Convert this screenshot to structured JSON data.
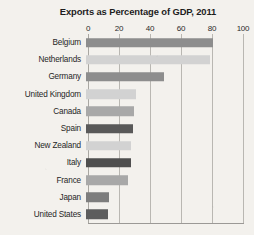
{
  "chart_data": {
    "type": "bar",
    "orientation": "horizontal",
    "title": "Exports as Percentage of GDP, 2011",
    "xlabel": "",
    "ylabel": "",
    "xlim": [
      0,
      100
    ],
    "xticks": [
      0,
      20,
      40,
      60,
      80,
      100
    ],
    "xtick_labels": [
      "0",
      "20",
      "40",
      "60",
      "80",
      "100"
    ],
    "grid": true,
    "legend": null,
    "categories": [
      "Belgium",
      "Netherlands",
      "Germany",
      "United Kingdom",
      "Canada",
      "Spain",
      "New Zealand",
      "Italy",
      "France",
      "Japan",
      "United States"
    ],
    "values": [
      82,
      80,
      50,
      32,
      31,
      30,
      29,
      29,
      27,
      15,
      14
    ],
    "bar_colors": [
      "#8d8d8d",
      "#d2d2d2",
      "#8d8d8d",
      "#d2d2d2",
      "#a8a8a8",
      "#595959",
      "#d2d2d2",
      "#4f4f4f",
      "#a8a8a8",
      "#7d7d7d",
      "#5d5d5d"
    ],
    "bars": [
      {
        "label": "Belgium",
        "value": 82,
        "color": "#8d8d8d"
      },
      {
        "label": "Netherlands",
        "value": 80,
        "color": "#d2d2d2"
      },
      {
        "label": "Germany",
        "value": 50,
        "color": "#8d8d8d"
      },
      {
        "label": "United Kingdom",
        "value": 32,
        "color": "#d2d2d2"
      },
      {
        "label": "Canada",
        "value": 31,
        "color": "#a8a8a8"
      },
      {
        "label": "Spain",
        "value": 30,
        "color": "#595959"
      },
      {
        "label": "New Zealand",
        "value": 29,
        "color": "#d2d2d2"
      },
      {
        "label": "Italy",
        "value": 29,
        "color": "#4f4f4f"
      },
      {
        "label": "France",
        "value": 27,
        "color": "#a8a8a8"
      },
      {
        "label": "Japan",
        "value": 15,
        "color": "#7d7d7d"
      },
      {
        "label": "United States",
        "value": 14,
        "color": "#5d5d5d"
      }
    ]
  },
  "style": {
    "background": "#f3f1ed",
    "gridline_color": "#b9b7b2",
    "text_color": "#262626"
  }
}
